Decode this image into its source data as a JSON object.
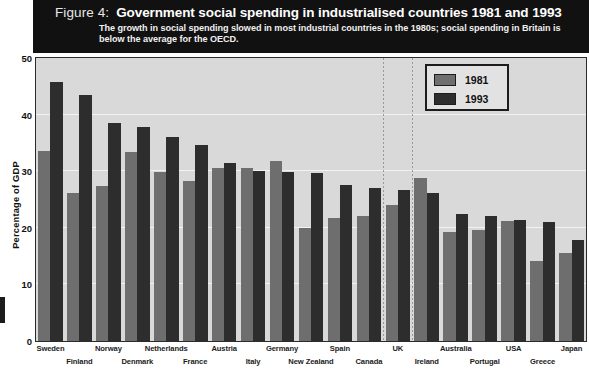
{
  "header": {
    "figure_number": "Figure 4:",
    "title": "Government social spending in industrialised countries 1981 and 1993",
    "subtitle": "The growth in social spending slowed in most industrial countries in the 1980s; social spending in Britain is below the average for the OECD."
  },
  "legend": {
    "items": [
      {
        "label": "1981",
        "color": "#6e6e6e"
      },
      {
        "label": "1993",
        "color": "#2d2d2d"
      }
    ]
  },
  "axes": {
    "ylabel": "Percentage of GDP",
    "yticks": [
      "0",
      "10",
      "20",
      "30",
      "40",
      "50"
    ]
  },
  "chart_data": {
    "type": "bar",
    "title": "Government social spending in industrialised countries 1981 and 1993",
    "subtitle": "The growth in social spending slowed in most industrial countries in the 1980s; social spending in Britain is below the average for the OECD.",
    "xlabel": "",
    "ylabel": "Percentage of GDP",
    "ylim": [
      0,
      50
    ],
    "ytick_values": [
      0,
      10,
      20,
      30,
      40,
      50
    ],
    "grid": true,
    "legend_position": "top-right",
    "highlight": {
      "category": "UK",
      "style": "dotted-vertical-lines"
    },
    "categories": [
      "Sweden",
      "Finland",
      "Norway",
      "Denmark",
      "Netherlands",
      "France",
      "Austria",
      "Italy",
      "Germany",
      "New Zealand",
      "Spain",
      "Canada",
      "UK",
      "Ireland",
      "Australia",
      "Portugal",
      "USA",
      "Greece",
      "Japan"
    ],
    "series": [
      {
        "name": "1981",
        "color": "#6e6e6e",
        "values": [
          33.5,
          26.2,
          27.4,
          33.4,
          29.8,
          28.2,
          30.5,
          30.6,
          31.8,
          20.0,
          21.8,
          22.0,
          24.1,
          28.8,
          19.3,
          19.6,
          21.2,
          14.2,
          15.5
        ]
      },
      {
        "name": "1993",
        "color": "#2d2d2d",
        "values": [
          45.8,
          43.4,
          38.6,
          37.9,
          36.0,
          34.7,
          31.5,
          30.1,
          29.9,
          29.6,
          27.5,
          27.1,
          26.6,
          26.1,
          22.4,
          22.1,
          21.3,
          21.1,
          17.8
        ]
      }
    ]
  }
}
